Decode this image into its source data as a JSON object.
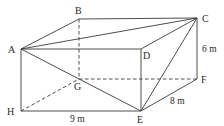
{
  "figure": {
    "type": "cuboid-diagram",
    "vertices": {
      "A": {
        "label": "A",
        "x": 21,
        "y": 49
      },
      "B": {
        "label": "B",
        "x": 79,
        "y": 19
      },
      "C": {
        "label": "C",
        "x": 197,
        "y": 18
      },
      "D": {
        "label": "D",
        "x": 141,
        "y": 49
      },
      "E": {
        "label": "E",
        "x": 141,
        "y": 111
      },
      "F": {
        "label": "F",
        "x": 197,
        "y": 79
      },
      "G": {
        "label": "G",
        "x": 79,
        "y": 79
      },
      "H": {
        "label": "H",
        "x": 21,
        "y": 111
      }
    },
    "solid_edges": [
      [
        "A",
        "B"
      ],
      [
        "B",
        "C"
      ],
      [
        "A",
        "D"
      ],
      [
        "D",
        "C"
      ],
      [
        "A",
        "H"
      ],
      [
        "H",
        "E"
      ],
      [
        "D",
        "E"
      ],
      [
        "C",
        "F"
      ],
      [
        "F",
        "E"
      ],
      [
        "A",
        "C"
      ],
      [
        "A",
        "E"
      ],
      [
        "C",
        "E"
      ]
    ],
    "dashed_edges": [
      [
        "B",
        "G"
      ],
      [
        "H",
        "G"
      ],
      [
        "G",
        "F"
      ]
    ],
    "measurements": {
      "height": "6 m",
      "length": "9 m",
      "width": "8 m"
    }
  }
}
